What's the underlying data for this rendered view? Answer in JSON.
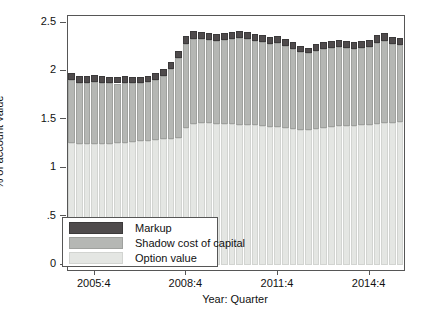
{
  "figure": {
    "background": "#ffffff",
    "frame_color": "#565656"
  },
  "chart_data": {
    "type": "bar",
    "stacked": true,
    "title": "",
    "xlabel": "Year: Quarter",
    "ylabel": "% of account value",
    "ylim": [
      0,
      2.5
    ],
    "grid": false,
    "legend_position": "bottom-left",
    "ytick_values": [
      0,
      0.5,
      1,
      1.5,
      2,
      2.5
    ],
    "ytick_labels": [
      "0",
      ".5",
      "1",
      "1.5",
      "2",
      "2.5"
    ],
    "xtick_labels": [
      "2005:4",
      "2008:4",
      "2011:4",
      "2014:4"
    ],
    "xtick_indices": [
      3,
      15,
      27,
      39
    ],
    "categories": [
      "2005:1",
      "2005:2",
      "2005:3",
      "2005:4",
      "2006:1",
      "2006:2",
      "2006:3",
      "2006:4",
      "2007:1",
      "2007:2",
      "2007:3",
      "2007:4",
      "2008:1",
      "2008:2",
      "2008:3",
      "2008:4",
      "2009:1",
      "2009:2",
      "2009:3",
      "2009:4",
      "2010:1",
      "2010:2",
      "2010:3",
      "2010:4",
      "2011:1",
      "2011:2",
      "2011:3",
      "2011:4",
      "2012:1",
      "2012:2",
      "2012:3",
      "2012:4",
      "2013:1",
      "2013:2",
      "2013:3",
      "2013:4",
      "2014:1",
      "2014:2",
      "2014:3",
      "2014:4",
      "2015:1",
      "2015:2",
      "2015:3",
      "2015:4"
    ],
    "series": [
      {
        "name": "Markup",
        "color": "#4f4b4c",
        "border": "#3c3a3b",
        "values": [
          0.07,
          0.07,
          0.07,
          0.07,
          0.07,
          0.07,
          0.07,
          0.07,
          0.06,
          0.06,
          0.06,
          0.07,
          0.07,
          0.07,
          0.08,
          0.08,
          0.08,
          0.07,
          0.07,
          0.07,
          0.07,
          0.07,
          0.07,
          0.07,
          0.07,
          0.07,
          0.07,
          0.07,
          0.07,
          0.07,
          0.06,
          0.06,
          0.07,
          0.07,
          0.07,
          0.07,
          0.07,
          0.07,
          0.07,
          0.07,
          0.08,
          0.08,
          0.07,
          0.07
        ]
      },
      {
        "name": "Shadow cost of capital",
        "color": "#b5b7b4",
        "border": "#9fa19e",
        "values": [
          0.65,
          0.63,
          0.63,
          0.64,
          0.63,
          0.62,
          0.61,
          0.62,
          0.61,
          0.6,
          0.61,
          0.62,
          0.65,
          0.72,
          0.82,
          0.87,
          0.88,
          0.87,
          0.86,
          0.86,
          0.87,
          0.88,
          0.9,
          0.89,
          0.87,
          0.87,
          0.86,
          0.87,
          0.85,
          0.83,
          0.81,
          0.79,
          0.81,
          0.82,
          0.82,
          0.82,
          0.81,
          0.8,
          0.8,
          0.81,
          0.84,
          0.85,
          0.82,
          0.8
        ]
      },
      {
        "name": "Option value",
        "color": "#e4e6e3",
        "border": "#d2d4d1",
        "values": [
          1.26,
          1.25,
          1.25,
          1.25,
          1.25,
          1.25,
          1.26,
          1.26,
          1.27,
          1.28,
          1.28,
          1.29,
          1.3,
          1.3,
          1.31,
          1.41,
          1.45,
          1.46,
          1.46,
          1.45,
          1.45,
          1.45,
          1.44,
          1.44,
          1.44,
          1.43,
          1.42,
          1.42,
          1.41,
          1.4,
          1.39,
          1.39,
          1.4,
          1.41,
          1.42,
          1.43,
          1.43,
          1.43,
          1.44,
          1.44,
          1.45,
          1.46,
          1.46,
          1.47
        ]
      }
    ]
  },
  "legend": {
    "items": [
      {
        "label": "Markup"
      },
      {
        "label": "Shadow cost of capital"
      },
      {
        "label": "Option value"
      }
    ]
  }
}
